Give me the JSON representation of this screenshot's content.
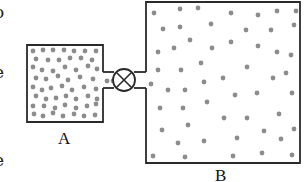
{
  "diagram": {
    "containers": [
      {
        "id": "A",
        "label": "A",
        "density": "high",
        "box": [
          27,
          45,
          103,
          122
        ]
      },
      {
        "id": "B",
        "label": "B",
        "density": "low",
        "box": [
          146,
          2,
          300,
          163
        ]
      }
    ],
    "valve": {
      "type": "stopcock",
      "symbol": "circle-with-x",
      "center": [
        124,
        80
      ],
      "radius": 11
    },
    "colors": {
      "stroke": "#2a2a2a",
      "particle": "#8c8c8c",
      "background": "#ffffff"
    },
    "edge_text_fragments": [
      {
        "char": "o",
        "y": 4
      },
      {
        "char": "-",
        "y": 28
      },
      {
        "char": "e",
        "y": 64
      },
      {
        "char": ".",
        "y": 90
      },
      {
        "char": ".",
        "y": 100
      },
      {
        "char": "-",
        "y": 128
      },
      {
        "char": "e",
        "y": 152
      }
    ],
    "particles_A": [
      [
        33,
        51
      ],
      [
        43,
        50
      ],
      [
        53,
        50
      ],
      [
        64,
        50
      ],
      [
        74,
        51
      ],
      [
        85,
        51
      ],
      [
        96,
        51
      ],
      [
        36,
        59
      ],
      [
        48,
        60
      ],
      [
        59,
        60
      ],
      [
        70,
        58
      ],
      [
        81,
        58
      ],
      [
        92,
        60
      ],
      [
        33,
        67
      ],
      [
        42,
        70
      ],
      [
        53,
        71
      ],
      [
        65,
        67
      ],
      [
        76,
        70
      ],
      [
        88,
        66
      ],
      [
        97,
        69
      ],
      [
        36,
        78
      ],
      [
        46,
        79
      ],
      [
        58,
        76
      ],
      [
        68,
        80
      ],
      [
        80,
        77
      ],
      [
        93,
        79
      ],
      [
        33,
        87
      ],
      [
        42,
        90
      ],
      [
        51,
        88
      ],
      [
        62,
        86
      ],
      [
        72,
        90
      ],
      [
        84,
        87
      ],
      [
        96,
        89
      ],
      [
        36,
        96
      ],
      [
        46,
        99
      ],
      [
        56,
        98
      ],
      [
        66,
        96
      ],
      [
        76,
        99
      ],
      [
        88,
        96
      ],
      [
        97,
        99
      ],
      [
        33,
        106
      ],
      [
        44,
        106
      ],
      [
        55,
        108
      ],
      [
        65,
        105
      ],
      [
        76,
        108
      ],
      [
        87,
        106
      ],
      [
        96,
        104
      ],
      [
        34,
        114
      ],
      [
        43,
        116
      ],
      [
        53,
        113
      ],
      [
        63,
        116
      ],
      [
        74,
        114
      ],
      [
        84,
        116
      ],
      [
        95,
        115
      ],
      [
        107,
        81
      ],
      [
        113,
        81
      ]
    ],
    "particles_B": [
      [
        154,
        13
      ],
      [
        180,
        9
      ],
      [
        198,
        8
      ],
      [
        231,
        13
      ],
      [
        258,
        15
      ],
      [
        277,
        11
      ],
      [
        296,
        11
      ],
      [
        163,
        29
      ],
      [
        180,
        27
      ],
      [
        211,
        24
      ],
      [
        246,
        30
      ],
      [
        271,
        30
      ],
      [
        294,
        25
      ],
      [
        190,
        40
      ],
      [
        231,
        42
      ],
      [
        258,
        46
      ],
      [
        158,
        52
      ],
      [
        174,
        48
      ],
      [
        212,
        48
      ],
      [
        277,
        52
      ],
      [
        291,
        55
      ],
      [
        158,
        70
      ],
      [
        181,
        70
      ],
      [
        201,
        63
      ],
      [
        247,
        67
      ],
      [
        286,
        73
      ],
      [
        273,
        78
      ],
      [
        151,
        84
      ],
      [
        168,
        90
      ],
      [
        185,
        90
      ],
      [
        204,
        82
      ],
      [
        223,
        78
      ],
      [
        235,
        95
      ],
      [
        257,
        93
      ],
      [
        292,
        93
      ],
      [
        160,
        108
      ],
      [
        183,
        108
      ],
      [
        207,
        102
      ],
      [
        224,
        118
      ],
      [
        247,
        118
      ],
      [
        279,
        114
      ],
      [
        162,
        130
      ],
      [
        188,
        125
      ],
      [
        264,
        131
      ],
      [
        294,
        129
      ],
      [
        178,
        143
      ],
      [
        204,
        141
      ],
      [
        237,
        138
      ],
      [
        281,
        139
      ],
      [
        153,
        156
      ],
      [
        185,
        157
      ],
      [
        233,
        156
      ],
      [
        262,
        153
      ],
      [
        292,
        155
      ]
    ]
  }
}
